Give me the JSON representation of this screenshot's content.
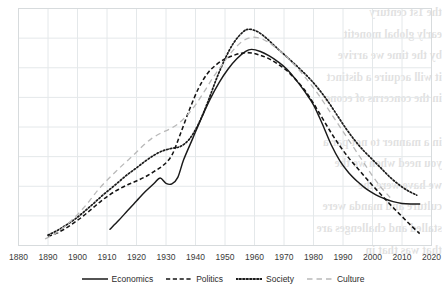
{
  "chart_data": {
    "type": "line",
    "title": "",
    "subtitle": "",
    "xlabel": "",
    "ylabel": "",
    "xlim": [
      1880,
      2020
    ],
    "ylim": [
      0,
      8
    ],
    "grid": true,
    "grid_x_step": 10,
    "grid_y_step": 1,
    "legend_position": "bottom",
    "xticks": [
      1880,
      1890,
      1900,
      1910,
      1920,
      1930,
      1940,
      1950,
      1960,
      1970,
      1980,
      1990,
      2000,
      2010,
      2020
    ],
    "xtick_labels": [
      "1880",
      "1890",
      "1900",
      "1910",
      "1920",
      "1930",
      "1940",
      "1950",
      "1960",
      "1970",
      "1980",
      "1990",
      "2000",
      "2010",
      "2020"
    ],
    "yticks": [
      0,
      1,
      2,
      3,
      4,
      5,
      6,
      7,
      8
    ],
    "ytick_labels": [
      "",
      "",
      "",
      "",
      "",
      "",
      "",
      "",
      ""
    ],
    "series": [
      {
        "name": "Economics",
        "style": "solid",
        "color": "#1a1a1a",
        "x": [
          1911,
          1914,
          1917,
          1920,
          1923,
          1926,
          1928,
          1930,
          1932,
          1934,
          1936,
          1939,
          1942,
          1945,
          1948,
          1951,
          1954,
          1957,
          1959,
          1962,
          1965,
          1968,
          1971,
          1974,
          1977,
          1980,
          1983,
          1986,
          1989,
          1992,
          1995,
          1998,
          2001,
          2004,
          2007,
          2010,
          2013,
          2016
        ],
        "y": [
          0.55,
          0.85,
          1.18,
          1.5,
          1.82,
          2.1,
          2.28,
          2.1,
          2.08,
          2.3,
          2.9,
          3.6,
          4.3,
          4.95,
          5.5,
          5.95,
          6.3,
          6.55,
          6.62,
          6.55,
          6.4,
          6.2,
          5.95,
          5.6,
          5.2,
          4.75,
          4.1,
          3.4,
          2.85,
          2.45,
          2.15,
          1.9,
          1.72,
          1.58,
          1.48,
          1.42,
          1.4,
          1.4
        ],
        "note": "solid black; local bump ~1928 then dip/plateau 1930-1932; peak ~1959; flattens after 2007"
      },
      {
        "name": "Politics",
        "style": "dashed",
        "color": "#141414",
        "x": [
          1890,
          1893,
          1896,
          1899,
          1902,
          1905,
          1908,
          1911,
          1914,
          1917,
          1920,
          1923,
          1926,
          1929,
          1932,
          1935,
          1938,
          1941,
          1944,
          1947,
          1950,
          1953,
          1956,
          1959,
          1962,
          1965,
          1968,
          1971,
          1974,
          1977,
          1980,
          1983,
          1986,
          1989,
          1992,
          1995,
          1998,
          2001,
          2004,
          2007,
          2010,
          2013,
          2016
        ],
        "y": [
          0.3,
          0.42,
          0.58,
          0.78,
          1.0,
          1.25,
          1.5,
          1.72,
          1.9,
          2.05,
          2.18,
          2.32,
          2.5,
          2.7,
          3.05,
          3.8,
          4.6,
          5.3,
          5.8,
          6.1,
          6.3,
          6.42,
          6.5,
          6.5,
          6.42,
          6.3,
          6.12,
          5.9,
          5.6,
          5.25,
          4.8,
          4.3,
          3.8,
          3.35,
          2.95,
          2.6,
          2.25,
          1.92,
          1.6,
          1.28,
          0.98,
          0.68,
          0.4
        ],
        "note": "black dashed; steep rise 1935-1950; falls steeply and lowest at the right end"
      },
      {
        "name": "Society",
        "style": "dotted",
        "color": "#1a1a1a",
        "x": [
          1890,
          1893,
          1896,
          1899,
          1902,
          1905,
          1908,
          1911,
          1914,
          1917,
          1920,
          1923,
          1926,
          1929,
          1932,
          1935,
          1938,
          1941,
          1944,
          1947,
          1950,
          1953,
          1956,
          1958,
          1961,
          1964,
          1967,
          1970,
          1973,
          1976,
          1979,
          1982,
          1985,
          1988,
          1991,
          1994,
          1997,
          2000,
          2003,
          2006,
          2009,
          2012,
          2015
        ],
        "y": [
          0.35,
          0.5,
          0.68,
          0.88,
          1.12,
          1.38,
          1.65,
          1.9,
          2.15,
          2.4,
          2.62,
          2.85,
          3.05,
          3.2,
          3.28,
          3.35,
          3.6,
          4.1,
          4.8,
          5.6,
          6.3,
          6.85,
          7.2,
          7.3,
          7.22,
          7.0,
          6.72,
          6.45,
          6.18,
          5.9,
          5.6,
          5.25,
          4.85,
          4.4,
          3.95,
          3.55,
          3.2,
          2.9,
          2.6,
          2.3,
          2.05,
          1.85,
          1.7
        ],
        "note": "black dotted; plateau 1929-1938; highest peak ~7.3 at 1958; highest of all at the right end"
      },
      {
        "name": "Culture",
        "style": "dash-light",
        "color": "#b9b9b9",
        "x": [
          1889,
          1892,
          1895,
          1898,
          1901,
          1904,
          1907,
          1910,
          1913,
          1916,
          1919,
          1922,
          1925,
          1928,
          1931,
          1934,
          1937,
          1940,
          1943,
          1946,
          1949,
          1952,
          1955,
          1958,
          1961,
          1964,
          1967,
          1970,
          1973,
          1976,
          1979,
          1982,
          1985,
          1988,
          1991,
          1994,
          1997,
          2000,
          2003,
          2006
        ],
        "y": [
          0.22,
          0.38,
          0.58,
          0.85,
          1.15,
          1.5,
          1.88,
          2.2,
          2.5,
          2.78,
          3.05,
          3.35,
          3.6,
          3.78,
          3.92,
          4.1,
          4.38,
          4.75,
          5.2,
          5.68,
          6.1,
          6.5,
          6.82,
          7.0,
          7.02,
          6.9,
          6.7,
          6.45,
          6.15,
          5.82,
          5.45,
          5.05,
          4.6,
          4.15,
          3.7,
          3.25,
          2.8,
          2.35,
          1.95,
          1.62
        ],
        "note": "light grey long-dash; second highest peak ~7.0 at 1959; ends earliest near 2006"
      }
    ],
    "legend": [
      {
        "label": "Economics",
        "style": "solid",
        "color": "#1a1a1a"
      },
      {
        "label": "Politics",
        "style": "dashed",
        "color": "#141414"
      },
      {
        "label": "Society",
        "style": "dotted",
        "color": "#1a1a1a"
      },
      {
        "label": "Culture",
        "style": "dash-light",
        "color": "#b9b9b9"
      }
    ],
    "colors": {
      "grid": "#e4e8ea",
      "axis": "#d7dbdd",
      "background": "#ffffff",
      "tick_text": "#3a3a3a"
    }
  },
  "bleed_text": "the 1st century\nearly global monetit\nby the time we arrive\nit will acquire a distinct\nin the concerns of econo\n\nin a manner to not par a\nyou need when we the\nwe have were the\nculture and manda were\nstalled and challenges are\nthat was that in"
}
